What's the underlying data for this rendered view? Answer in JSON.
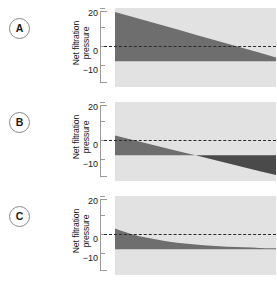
{
  "figure": {
    "background_color": "#ffffff",
    "plot_bg_color": "#e2e2e2",
    "fill_color": "#6e6e6e",
    "fill_color_negative": "#4a4a4a",
    "zero_line_color": "#2b2b2b",
    "axis_color": "#9a9a9a"
  },
  "panels": [
    {
      "label": "A",
      "axis_title_line1": "Net filtration",
      "axis_title_line2": "pressure",
      "ticks": [
        {
          "value": 20,
          "label": "20"
        },
        {
          "value": 10,
          "label": ""
        },
        {
          "value": 0,
          "label": "0"
        },
        {
          "value": -10,
          "label": "−10"
        }
      ]
    },
    {
      "label": "B",
      "axis_title_line1": "Net filtration",
      "axis_title_line2": "pressure",
      "ticks": [
        {
          "value": 20,
          "label": "20"
        },
        {
          "value": 10,
          "label": ""
        },
        {
          "value": 0,
          "label": "0"
        },
        {
          "value": -10,
          "label": "−10"
        }
      ]
    },
    {
      "label": "C",
      "axis_title_line1": "Net filtration",
      "axis_title_line2": "pressure",
      "ticks": [
        {
          "value": 20,
          "label": "20"
        },
        {
          "value": 10,
          "label": ""
        },
        {
          "value": 0,
          "label": "0"
        },
        {
          "value": -10,
          "label": "−10"
        }
      ]
    }
  ],
  "chart_data": [
    {
      "type": "area",
      "title": "A",
      "xlabel": "",
      "ylabel": "Net filtration pressure",
      "ylim": [
        -13,
        27
      ],
      "xlim": [
        0,
        100
      ],
      "grid": false,
      "legend": "none",
      "tick_labels": [
        "20",
        "0",
        "−10"
      ],
      "tick_values": [
        20,
        0,
        -10
      ],
      "x": [
        0,
        10,
        20,
        30,
        40,
        50,
        60,
        70,
        80,
        90,
        100
      ],
      "values": [
        25,
        22.7,
        20.4,
        18.1,
        15.8,
        13.5,
        11.2,
        8.9,
        6.6,
        4.3,
        2.0
      ],
      "annotations": [
        "zero reference dashed line at y = 0"
      ]
    },
    {
      "type": "area",
      "title": "B",
      "xlabel": "",
      "ylabel": "Net filtration pressure",
      "ylim": [
        -13,
        27
      ],
      "xlim": [
        0,
        100
      ],
      "grid": false,
      "legend": "none",
      "tick_labels": [
        "20",
        "0",
        "−10"
      ],
      "tick_values": [
        20,
        0,
        -10
      ],
      "x": [
        0,
        10,
        20,
        30,
        40,
        50,
        60,
        70,
        80,
        90,
        100
      ],
      "values": [
        10,
        8,
        6,
        4,
        2,
        0,
        -2,
        -4,
        -6,
        -8,
        -10
      ],
      "annotations": [
        "crosses zero at x = 50",
        "zero reference dashed line at y = 0"
      ]
    },
    {
      "type": "area",
      "title": "C",
      "xlabel": "",
      "ylabel": "Net filtration pressure",
      "ylim": [
        -13,
        27
      ],
      "xlim": [
        0,
        100
      ],
      "grid": false,
      "legend": "none",
      "tick_labels": [
        "20",
        "0",
        "−10"
      ],
      "tick_values": [
        20,
        0,
        -10
      ],
      "x": [
        0,
        10,
        20,
        30,
        40,
        50,
        60,
        70,
        80,
        90,
        100
      ],
      "values": [
        10.5,
        7.8,
        5.8,
        4.3,
        3.2,
        2.4,
        1.8,
        1.3,
        1.0,
        0.7,
        0.5
      ],
      "annotations": [
        "exponential decay approaching zero",
        "zero reference dashed line at y = 0"
      ]
    }
  ]
}
